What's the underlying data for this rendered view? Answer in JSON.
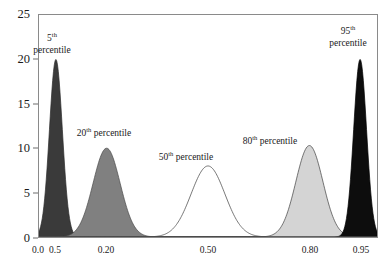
{
  "chart_data": {
    "type": "line",
    "title": "",
    "subtitle": "",
    "xlabel": "",
    "ylabel": "",
    "xlim": [
      0.0,
      1.0
    ],
    "ylim": [
      0,
      25
    ],
    "grid": false,
    "legend_position": "inline-annotations",
    "y_ticks": [
      0,
      5,
      10,
      15,
      20,
      25
    ],
    "x_ticks": [
      0.0,
      0.05,
      0.2,
      0.5,
      0.8,
      0.95
    ],
    "x_tick_labels": [
      "0.0",
      "0.5",
      "0.20",
      "0.50",
      "0.80",
      "0.95"
    ],
    "series": [
      {
        "name": "5th percentile",
        "label": "5",
        "ordinal_suffix": "th",
        "label_tail": "percentile",
        "mean": 0.05,
        "sd": 0.019,
        "peak": 20,
        "fill": "#3a3a3a",
        "stroke": "#2b2b2b",
        "filled": true
      },
      {
        "name": "20th percentile",
        "label": "20",
        "ordinal_suffix": "th",
        "label_tail": "percentile",
        "mean": 0.2,
        "sd": 0.04,
        "peak": 10,
        "fill": "#808080",
        "stroke": "#4a4a4a",
        "filled": true
      },
      {
        "name": "50th percentile",
        "label": "50",
        "ordinal_suffix": "th",
        "label_tail": "percentile",
        "mean": 0.5,
        "sd": 0.05,
        "peak": 8,
        "fill": "#ffffff",
        "stroke": "#555555",
        "filled": false
      },
      {
        "name": "80th percentile",
        "label": "80",
        "ordinal_suffix": "th",
        "label_tail": "percentile",
        "mean": 0.8,
        "sd": 0.04,
        "peak": 10.3,
        "fill": "#d4d4d4",
        "stroke": "#3f3f3f",
        "filled": true
      },
      {
        "name": "95th percentile",
        "label": "95",
        "ordinal_suffix": "th",
        "label_tail": "percentile",
        "mean": 0.95,
        "sd": 0.019,
        "peak": 20,
        "fill": "#0d0d0d",
        "stroke": "#000000",
        "filled": true
      }
    ],
    "annotations": [
      {
        "text": "5",
        "sup": "th",
        "tail": "percentile",
        "x_px": 52,
        "y_px": 33
      },
      {
        "text": "20",
        "sup": "th",
        "tail": "percentile",
        "x_px": 104,
        "y_px": 128
      },
      {
        "text": "50",
        "sup": "th",
        "tail": "percentile",
        "x_px": 186,
        "y_px": 152
      },
      {
        "text": "80",
        "sup": "th",
        "tail": "percentile",
        "x_px": 270,
        "y_px": 136
      },
      {
        "text": "95",
        "sup": "th",
        "tail": "percentile",
        "x_px": 348,
        "y_px": 26
      }
    ]
  },
  "axis": {
    "y_tick_labels": [
      "0",
      "5",
      "10",
      "15",
      "20",
      "25"
    ],
    "x_tick_labels": [
      "0.0",
      "0.5",
      "0.20",
      "0.50",
      "0.80",
      "0.95"
    ]
  },
  "colors": {
    "frame": "#8a8a8a",
    "text": "#1a1a1a",
    "background": "#ffffff"
  }
}
